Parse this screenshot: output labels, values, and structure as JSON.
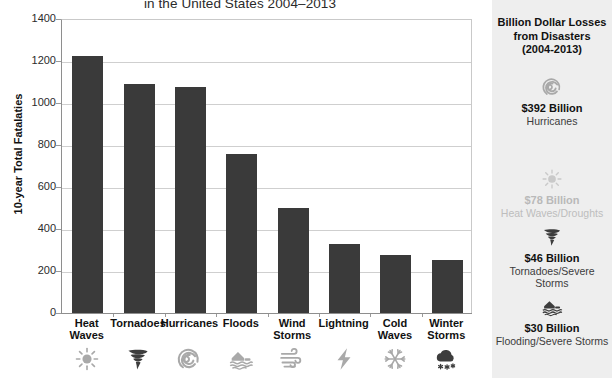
{
  "chart_data": {
    "type": "bar",
    "title": "in the United States 2004–2013",
    "xlabel": "",
    "ylabel": "10-year Total Fatalaties",
    "ylim": [
      0,
      1400
    ],
    "yticks": [
      "0",
      "200",
      "400",
      "600",
      "800",
      "1000",
      "1200",
      "1400"
    ],
    "grid": true,
    "legend": "none",
    "bar_color": "#3a3a3a",
    "categories": [
      "Heat Waves",
      "Tornadoes",
      "Hurricanes",
      "Floods",
      "Wind Storms",
      "Lightning",
      "Cold Waves",
      "Winter Storms"
    ],
    "values": [
      1225,
      1090,
      1078,
      755,
      500,
      330,
      275,
      253
    ],
    "category_lines": [
      [
        "Heat",
        "Waves"
      ],
      [
        "Tornadoes"
      ],
      [
        "Hurricanes"
      ],
      [
        "Floods"
      ],
      [
        "Wind",
        "Storms"
      ],
      [
        "Lightning"
      ],
      [
        "Cold",
        "Waves"
      ],
      [
        "Winter",
        "Storms"
      ]
    ],
    "category_icons": [
      "sun-icon",
      "tornado-icon",
      "hurricane-spiral-icon",
      "flood-house-icon",
      "wind-icon",
      "lightning-bolt-icon",
      "snowflake-icon",
      "snow-cloud-icon"
    ]
  },
  "sidebar": {
    "title_lines": [
      "Billion Dollar Losses",
      "from Disasters",
      "(2004-2013)"
    ],
    "background": "#eeeeee",
    "entries": [
      {
        "icon": "hurricane-spiral-icon",
        "amount": "$392 Billion",
        "category": "Hurricanes",
        "faded": false
      },
      {
        "icon": "sun-icon",
        "amount": "$78 Billion",
        "category": "Heat Waves/Droughts",
        "faded": true
      },
      {
        "icon": "tornado-icon",
        "amount": "$46 Billion",
        "category": "Tornadoes/Severe Storms",
        "faded": false
      },
      {
        "icon": "flood-house-icon",
        "amount": "$30 Billion",
        "category": "Flooding/Severe Storms",
        "faded": false
      }
    ]
  }
}
